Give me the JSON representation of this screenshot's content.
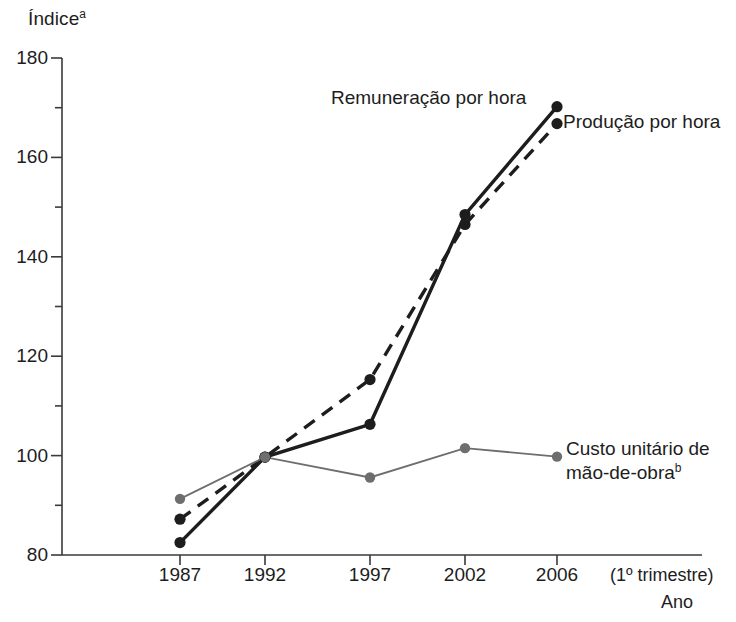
{
  "chart_data": {
    "type": "line",
    "title": "",
    "ylabel": "Índice",
    "ylabel_sup": "a",
    "xlabel": "Ano",
    "x_note": "(1º trimestre)",
    "categories": [
      "1987",
      "1992",
      "1997",
      "2002",
      "2006"
    ],
    "ylim": [
      80,
      180
    ],
    "yticks": [
      80,
      100,
      120,
      140,
      160,
      180
    ],
    "yticks_minor": [
      90,
      110,
      130,
      150,
      170
    ],
    "ytick_labels": [
      "80",
      "100",
      "120",
      "140",
      "160",
      "180"
    ],
    "grid": false,
    "legend_position": "inline-annotations",
    "series": [
      {
        "name": "Remuneração por hora",
        "style": "solid",
        "color": "#1d1d1d",
        "values": [
          82.5,
          99.7,
          106.3,
          148.5,
          170.2
        ]
      },
      {
        "name": "Produção por hora",
        "style": "dashed",
        "color": "#1d1d1d",
        "values": [
          87.2,
          99.7,
          115.3,
          146.5,
          166.8
        ]
      },
      {
        "name": "Custo unitário de mão-de-obra",
        "name_sup": "b",
        "style": "solid-thin",
        "color": "#6e6e6e",
        "values": [
          91.3,
          99.7,
          95.6,
          101.5,
          99.8
        ]
      }
    ],
    "annotations": [
      {
        "text": "Remuneração por hora",
        "series": "Remuneração por hora"
      },
      {
        "text": "Produção por hora",
        "series": "Produção por hora"
      },
      {
        "text": "Custo unitário de",
        "text2": "mão-de-obra",
        "sup": "b",
        "series": "Custo unitário de mão-de-obra"
      }
    ]
  },
  "colors": {
    "axis": "#3a3a3a",
    "primary": "#1d1d1d",
    "secondary": "#6e6e6e",
    "background": "#ffffff"
  }
}
